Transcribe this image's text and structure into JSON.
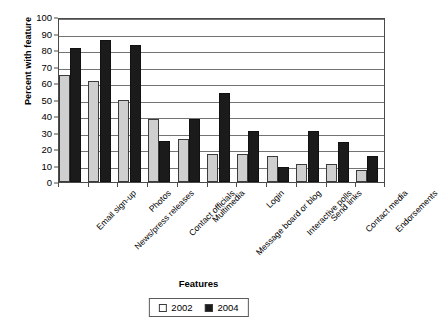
{
  "chart_data": {
    "type": "bar",
    "title": "",
    "xlabel": "Features",
    "ylabel": "Percent with feature",
    "ylim": [
      0,
      100
    ],
    "ytick_step": 10,
    "yticks": [
      0,
      10,
      20,
      30,
      40,
      50,
      60,
      70,
      80,
      90,
      100
    ],
    "grid": true,
    "grid_axis": "y",
    "legend_position": "below-plot",
    "categories": [
      "Email sign-up",
      "News/press releases",
      "Photos",
      "Contact officials",
      "Multimedia",
      "Message board or blog",
      "Login",
      "Interactive polls",
      "Send links",
      "Contact media",
      "Endorsements"
    ],
    "series": [
      {
        "name": "2002",
        "color": "#cfcfcf",
        "values": [
          65,
          61,
          50,
          38,
          26,
          17,
          17,
          16,
          11,
          11,
          7
        ]
      },
      {
        "name": "2004",
        "color": "#1b1b1b",
        "values": [
          81,
          86,
          83,
          25,
          38,
          54,
          31,
          9,
          31,
          24,
          16
        ]
      }
    ]
  },
  "legend": {
    "items": [
      {
        "label": "2002",
        "swatch": "s2002"
      },
      {
        "label": "2004",
        "swatch": "s2004"
      }
    ]
  }
}
